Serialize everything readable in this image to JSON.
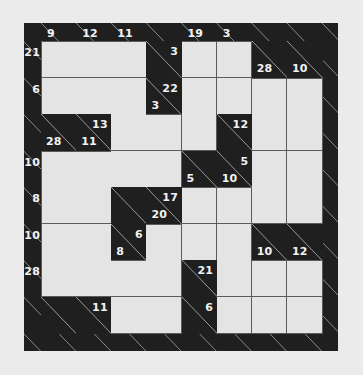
{
  "puzzle": {
    "type": "kakuro",
    "rows": 8,
    "cols": 8,
    "column_clues_top": [
      {
        "col": 0,
        "down": "9"
      },
      {
        "col": 1,
        "down": "12"
      },
      {
        "col": 2,
        "down": "11"
      },
      {
        "col": 4,
        "down": "19"
      },
      {
        "col": 5,
        "down": "3"
      }
    ],
    "row_clues_left": [
      {
        "row": 0,
        "across": "21"
      },
      {
        "row": 1,
        "across": "6"
      },
      {
        "row": 3,
        "across": "10"
      },
      {
        "row": 4,
        "across": "8"
      },
      {
        "row": 5,
        "across": "10"
      },
      {
        "row": 6,
        "across": "28"
      }
    ],
    "layout": [
      "WWWBWWBB",
      "WWWBWWWW",
      "BBWWWBWW",
      "WWWWBBWW",
      "WWBBWWWW",
      "WWBWWWBB",
      "WWWWBWWW",
      "BBWWBWWW"
    ],
    "block_clues": [
      {
        "row": 0,
        "col": 3,
        "across": "3"
      },
      {
        "row": 0,
        "col": 6,
        "down": "28"
      },
      {
        "row": 0,
        "col": 7,
        "down": "10"
      },
      {
        "row": 1,
        "col": 3,
        "across": "22",
        "down": "3"
      },
      {
        "row": 2,
        "col": 0,
        "down": "28"
      },
      {
        "row": 2,
        "col": 1,
        "across": "13",
        "down": "11"
      },
      {
        "row": 2,
        "col": 5,
        "across": "12"
      },
      {
        "row": 3,
        "col": 4,
        "down": "5"
      },
      {
        "row": 3,
        "col": 5,
        "across": "5",
        "down": "10"
      },
      {
        "row": 4,
        "col": 3,
        "across": "17",
        "down": "20"
      },
      {
        "row": 5,
        "col": 2,
        "across": "6",
        "down": "8"
      },
      {
        "row": 5,
        "col": 6,
        "down": "10"
      },
      {
        "row": 5,
        "col": 7,
        "down": "12"
      },
      {
        "row": 6,
        "col": 4,
        "across": "21"
      },
      {
        "row": 7,
        "col": 1,
        "across": "11"
      },
      {
        "row": 7,
        "col": 4,
        "across": "6"
      }
    ],
    "entries": []
  },
  "colors": {
    "block": "#1f1f1f",
    "cell": "#e4e4e4",
    "clue_text": "#f2f2f2",
    "background": "#ebebeb"
  }
}
